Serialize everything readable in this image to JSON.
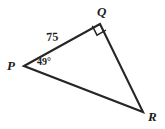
{
  "figure": {
    "kind": "geometry-diagram",
    "shape": "triangle",
    "background_color": "#ffffff",
    "stroke_color": "#262626",
    "text_color": "#1c1c1c",
    "vertices": [
      {
        "name": "P",
        "label": "P",
        "x": 24,
        "y": 66
      },
      {
        "name": "Q",
        "label": "Q",
        "x": 100,
        "y": 24
      },
      {
        "name": "R",
        "label": "R",
        "x": 143,
        "y": 112
      }
    ],
    "sides": [
      {
        "name": "PQ",
        "from": "P",
        "to": "Q",
        "label": "75"
      },
      {
        "name": "QR",
        "from": "Q",
        "to": "R",
        "label": ""
      },
      {
        "name": "PR",
        "from": "P",
        "to": "R",
        "label": ""
      }
    ],
    "angles": [
      {
        "at": "P",
        "label": "49°",
        "marker": "none"
      },
      {
        "at": "Q",
        "label": "",
        "marker": "right-angle-square"
      }
    ],
    "labels": {
      "side_pq": "75",
      "angle_p": "49°",
      "vertex_p": "P",
      "vertex_q": "Q",
      "vertex_r": "R"
    }
  }
}
